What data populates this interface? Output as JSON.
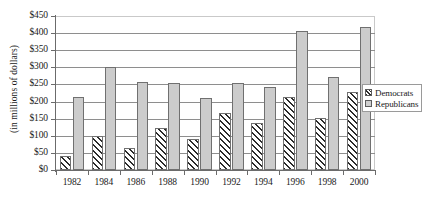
{
  "chart_data": {
    "type": "bar",
    "title": "",
    "xlabel": "",
    "ylabel": "(in millions of dollars)",
    "ylim": [
      0,
      450
    ],
    "ytick_step": 50,
    "grid": true,
    "legend_position": "right",
    "categories": [
      "1982",
      "1984",
      "1986",
      "1988",
      "1990",
      "1992",
      "1994",
      "1996",
      "1998",
      "2000"
    ],
    "ytick_labels": [
      "$0",
      "$50",
      "$100",
      "$150",
      "$200",
      "$250",
      "$300",
      "$350",
      "$400",
      "$450"
    ],
    "ytick_values": [
      0,
      50,
      100,
      150,
      200,
      250,
      300,
      350,
      400,
      450
    ],
    "series": [
      {
        "name": "Democrats",
        "fill": "diagonal-hatch",
        "color": "#2b2b2b",
        "values": [
          40,
          98,
          64,
          122,
          90,
          168,
          138,
          212,
          152,
          228
        ]
      },
      {
        "name": "Republicans",
        "fill": "solid-gray",
        "color": "#cccccc",
        "values": [
          212,
          301,
          258,
          255,
          210,
          253,
          243,
          405,
          272,
          418
        ]
      }
    ]
  },
  "legend": {
    "items": [
      {
        "label": "Democrats"
      },
      {
        "label": "Republicans"
      }
    ]
  }
}
